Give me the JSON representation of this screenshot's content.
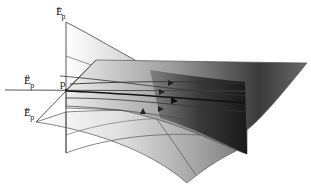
{
  "figure": {
    "point_label": "p",
    "labels": {
      "stable": {
        "base": "E",
        "sup": "s",
        "sub": "p"
      },
      "center": {
        "base": "E",
        "sup": "0",
        "sub": "p"
      },
      "unstable": {
        "base": "E",
        "sup": "u",
        "sub": "p"
      }
    },
    "colors": {
      "line": "#555555",
      "trajectory": "#333333",
      "surface_light": "#f4f4f4",
      "surface_dark": "#1a1a1a",
      "background": "#ffffff"
    },
    "trajectory_count": 6
  }
}
